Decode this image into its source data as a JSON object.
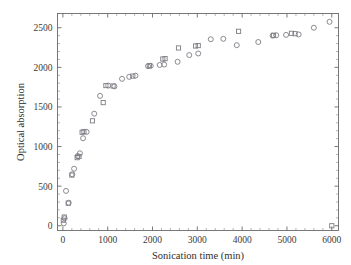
{
  "chart_data": {
    "type": "scatter",
    "title": "",
    "xlabel": "Sonication time (min)",
    "ylabel": "Optical absorption",
    "xlim": [
      -120,
      6150
    ],
    "ylim": [
      -60,
      2680
    ],
    "xticks": [
      0,
      1000,
      2000,
      3000,
      4000,
      5000,
      6000
    ],
    "yticks": [
      0,
      500,
      1000,
      1500,
      2000,
      2500
    ],
    "xtick_labels": [
      "0",
      "1000",
      "2000",
      "3000",
      "4000",
      "5000",
      "6000"
    ],
    "ytick_labels": [
      "0",
      "500",
      "1000",
      "1500",
      "2000",
      "2500"
    ],
    "x_minor_per_major": 5,
    "y_minor_per_major": 5,
    "grid": false,
    "legend": "none",
    "frame": "box",
    "tick_direction": "in",
    "marker_color": "#7d7d85",
    "series": [
      {
        "name": "circles",
        "marker": "circle",
        "points": [
          [
            20,
            30
          ],
          [
            40,
            95
          ],
          [
            70,
            440
          ],
          [
            130,
            290
          ],
          [
            210,
            650
          ],
          [
            250,
            720
          ],
          [
            330,
            880
          ],
          [
            380,
            915
          ],
          [
            450,
            1105
          ],
          [
            530,
            1185
          ],
          [
            700,
            1415
          ],
          [
            830,
            1640
          ],
          [
            1010,
            1770
          ],
          [
            1150,
            1760
          ],
          [
            1320,
            1855
          ],
          [
            1480,
            1880
          ],
          [
            1620,
            1895
          ],
          [
            1900,
            2015
          ],
          [
            1960,
            2020
          ],
          [
            2160,
            2030
          ],
          [
            2260,
            2035
          ],
          [
            2560,
            2070
          ],
          [
            2820,
            2155
          ],
          [
            3020,
            2175
          ],
          [
            3300,
            2355
          ],
          [
            3580,
            2360
          ],
          [
            3880,
            2280
          ],
          [
            4360,
            2320
          ],
          [
            4680,
            2400
          ],
          [
            4760,
            2405
          ],
          [
            4980,
            2410
          ],
          [
            5260,
            2415
          ],
          [
            5600,
            2500
          ],
          [
            5950,
            2575
          ]
        ]
      },
      {
        "name": "squares",
        "marker": "square",
        "points": [
          [
            10,
            70
          ],
          [
            30,
            110
          ],
          [
            120,
            285
          ],
          [
            200,
            640
          ],
          [
            320,
            860
          ],
          [
            360,
            875
          ],
          [
            430,
            1180
          ],
          [
            470,
            1190
          ],
          [
            660,
            1325
          ],
          [
            900,
            1555
          ],
          [
            960,
            1770
          ],
          [
            1120,
            1765
          ],
          [
            1560,
            1890
          ],
          [
            1930,
            2020
          ],
          [
            2230,
            2105
          ],
          [
            2280,
            2110
          ],
          [
            2580,
            2245
          ],
          [
            2960,
            2270
          ],
          [
            3020,
            2275
          ],
          [
            3920,
            2455
          ],
          [
            4700,
            2405
          ],
          [
            5100,
            2430
          ],
          [
            5180,
            2425
          ],
          [
            6000,
            0
          ]
        ]
      }
    ]
  },
  "axes": {
    "x_title": "Sonication time (min)",
    "y_title": "Optical absorption"
  }
}
